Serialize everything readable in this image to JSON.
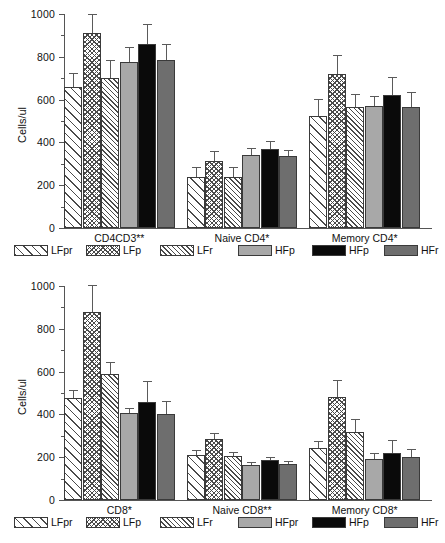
{
  "figure": {
    "y_axis_label": "Cells/ul",
    "y_ticks": [
      "0",
      "200",
      "400",
      "600",
      "800",
      "1000"
    ],
    "series_names": [
      "LFpr",
      "LFp",
      "LFr",
      "HFpr",
      "HFp",
      "HFr"
    ]
  },
  "panels": [
    {
      "id": "cd4-panel",
      "legend": [
        "LFpr",
        "LFp",
        "LFr",
        "HFp",
        "HFp",
        "HFr"
      ],
      "chart_data": {
        "type": "bar",
        "title": "",
        "xlabel": "",
        "ylabel": "Cells/ul",
        "ylim": [
          0,
          1000
        ],
        "yticks": [
          0,
          200,
          400,
          600,
          800,
          1000
        ],
        "grid": false,
        "legend_position": "below",
        "categories": [
          "CD4CD3**",
          "Naive CD4*",
          "Memory CD4*"
        ],
        "series": [
          {
            "name": "LFpr",
            "values": [
              660,
              240,
              525
            ],
            "errors": [
              65,
              45,
              80
            ]
          },
          {
            "name": "LFp",
            "values": [
              910,
              315,
              720
            ],
            "errors": [
              90,
              45,
              90
            ]
          },
          {
            "name": "LFr",
            "values": [
              703,
              240,
              565
            ],
            "errors": [
              82,
              45,
              60
            ]
          },
          {
            "name": "HFp",
            "values": [
              775,
              340,
              570
            ],
            "errors": [
              70,
              35,
              45
            ]
          },
          {
            "name": "HFp2",
            "values": [
              860,
              370,
              620
            ],
            "errors": [
              95,
              35,
              85
            ]
          },
          {
            "name": "HFr",
            "values": [
              785,
              335,
              565
            ],
            "errors": [
              75,
              30,
              70
            ]
          }
        ]
      }
    },
    {
      "id": "cd8-panel",
      "legend": [
        "LFpr",
        "LFp",
        "LFr",
        "HFpr",
        "HFp",
        "HFr"
      ],
      "chart_data": {
        "type": "bar",
        "title": "",
        "xlabel": "",
        "ylabel": "Cells/ul",
        "ylim": [
          0,
          1000
        ],
        "yticks": [
          0,
          200,
          400,
          600,
          800,
          1000
        ],
        "grid": false,
        "legend_position": "below",
        "categories": [
          "CD8*",
          "Naive CD8**",
          "Memory CD8*"
        ],
        "series": [
          {
            "name": "LFpr",
            "values": [
              478,
              212,
              242
            ],
            "errors": [
              38,
              22,
              36
            ]
          },
          {
            "name": "LFp",
            "values": [
              878,
              283,
              480
            ],
            "errors": [
              128,
              28,
              80
            ]
          },
          {
            "name": "LFr",
            "values": [
              587,
              204,
              320
            ],
            "errors": [
              58,
              20,
              58
            ]
          },
          {
            "name": "HFpr",
            "values": [
              405,
              162,
              192
            ],
            "errors": [
              27,
              14,
              28
            ]
          },
          {
            "name": "HFp",
            "values": [
              458,
              187,
              220
            ],
            "errors": [
              100,
              16,
              62
            ]
          },
          {
            "name": "HFr",
            "values": [
              403,
              170,
              202
            ],
            "errors": [
              60,
              14,
              38
            ]
          }
        ]
      }
    }
  ]
}
